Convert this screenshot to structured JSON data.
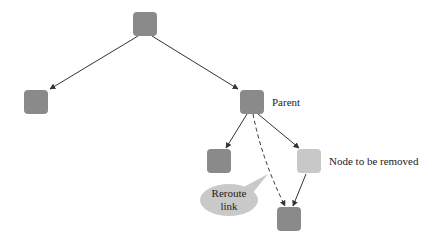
{
  "diagram": {
    "colors": {
      "node": "#8a8a8a",
      "removed_node": "#c8c8c8",
      "edge": "#333333",
      "bubble": "#c9c9c9"
    },
    "nodes": [
      {
        "id": "root",
        "label": ""
      },
      {
        "id": "left",
        "label": ""
      },
      {
        "id": "parent",
        "label": "Parent"
      },
      {
        "id": "parent-left-child",
        "label": ""
      },
      {
        "id": "removed",
        "label": "Node to be removed"
      },
      {
        "id": "grandchild",
        "label": ""
      }
    ],
    "edges": [
      {
        "from": "root",
        "to": "left",
        "style": "solid"
      },
      {
        "from": "root",
        "to": "parent",
        "style": "solid"
      },
      {
        "from": "parent",
        "to": "parent-left-child",
        "style": "solid"
      },
      {
        "from": "parent",
        "to": "removed",
        "style": "solid"
      },
      {
        "from": "removed",
        "to": "grandchild",
        "style": "solid"
      },
      {
        "from": "parent",
        "to": "grandchild",
        "style": "dashed"
      }
    ],
    "callout": {
      "line1": "Reroute",
      "line2": "link"
    }
  }
}
